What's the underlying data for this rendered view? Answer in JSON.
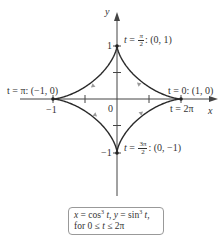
{
  "diagram": {
    "type": "parametric-curve",
    "curve_name": "astroid",
    "axes": {
      "x_label": "x",
      "y_label": "y",
      "origin_label": "0",
      "x_tick_labels": [
        "−1"
      ],
      "y_tick_labels": [
        "1",
        "−1"
      ],
      "x_ticks": [
        -1,
        -0.5,
        0.5,
        1
      ],
      "y_ticks": [
        1,
        0.5,
        -0.5,
        -1
      ]
    },
    "points": [
      {
        "name": "top",
        "t_prefix": "t = ",
        "t_num": "π",
        "t_den": "2",
        "coord": ": (0, 1)"
      },
      {
        "name": "left",
        "label": "t = π: (−1, 0)"
      },
      {
        "name": "right",
        "label": "t = 0: (1, 0)",
        "label2": "t = 2π"
      },
      {
        "name": "bottom",
        "t_prefix": "t = ",
        "t_num": "3π",
        "t_den": "2",
        "coord": ": (0, −1)"
      }
    ],
    "formula": {
      "line1": "x = cos³ t, y = sin³ t,",
      "line1_x": "x",
      "line1_eq1": " = cos",
      "line1_exp": "3",
      "line1_t1": " t",
      "line1_sep": ", ",
      "line1_y": "y",
      "line1_eq2": " = sin",
      "line1_exp2": "3",
      "line1_t2": " t",
      "line1_end": ",",
      "line2_pre": "for 0 ≤ ",
      "line2_t": "t",
      "line2_post": " ≤ 2π"
    },
    "colors": {
      "curve": "#2a2a2a",
      "axis": "#444444",
      "arrow_marker": "#9a9a9a",
      "box_border": "#999999"
    }
  }
}
